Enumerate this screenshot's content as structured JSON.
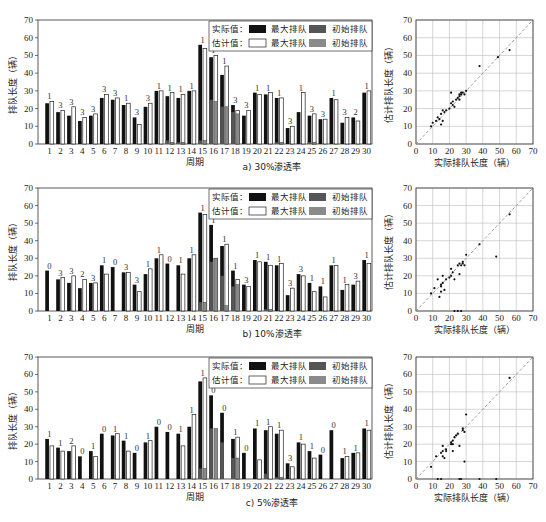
{
  "labels": {
    "y_bar": "排队长度（辆）",
    "x_bar": "周期",
    "y_scatter": "估计排队长度（辆）",
    "x_scatter": "实际排队长度（辆）",
    "legend_actual": "实际值：",
    "legend_est": "估计值：",
    "legend_max": "最大排队",
    "legend_init": "初始排队"
  },
  "colors": {
    "actual_max": "#111111",
    "actual_init": "#555555",
    "est_max": "#ffffff",
    "est_init": "#8a8a8a",
    "diag": "#888888"
  },
  "chart_data": [
    {
      "type": "bar",
      "caption": "a) 30%渗透率",
      "xlabel": "周期",
      "ylabel": "排队长度（辆）",
      "ylim": [
        0,
        70
      ],
      "categories": [
        1,
        2,
        3,
        4,
        5,
        6,
        7,
        8,
        9,
        10,
        11,
        12,
        13,
        14,
        15,
        16,
        17,
        18,
        19,
        20,
        21,
        22,
        23,
        24,
        25,
        26,
        27,
        28,
        29,
        30
      ],
      "series": [
        {
          "name": "实际值 最大排队",
          "values": [
            23,
            18,
            16,
            13,
            16,
            26,
            25,
            22,
            15,
            21,
            30,
            27,
            26,
            30,
            56,
            49,
            39,
            22,
            16,
            29,
            28,
            26,
            9,
            18,
            16,
            14,
            26,
            12,
            15,
            29
          ]
        },
        {
          "name": "估计值 最大排队",
          "values": [
            24,
            19,
            21,
            15,
            17,
            28,
            26,
            23,
            11,
            23,
            30,
            29,
            28,
            30,
            54,
            50,
            44,
            19,
            19,
            28,
            29,
            26,
            10,
            29,
            17,
            14,
            25,
            15,
            13,
            30
          ]
        },
        {
          "name": "实际值 初始排队",
          "values": [
            0,
            0,
            0,
            0,
            0,
            0,
            0,
            0,
            0,
            0,
            0,
            2,
            1,
            0,
            2,
            25,
            21,
            18,
            0,
            0,
            0,
            1,
            0,
            0,
            1,
            0,
            0,
            0,
            0,
            0
          ]
        },
        {
          "name": "估计值 初始排队",
          "values": [
            0,
            0,
            0,
            0,
            0,
            0,
            0,
            0,
            0,
            0,
            0,
            1,
            1,
            0,
            2,
            24,
            21,
            17,
            0,
            0,
            0,
            1,
            0,
            0,
            1,
            0,
            0,
            0,
            0,
            0
          ]
        }
      ],
      "annotations": [
        "1",
        "3",
        "3",
        "3",
        "3",
        "3",
        "3",
        "1",
        "3",
        "3",
        "1",
        "1",
        "1",
        "1",
        "1",
        "1",
        "1",
        "3",
        "3",
        "1",
        "1",
        "1",
        "3",
        "1",
        "3",
        "3",
        "1",
        "3",
        "2",
        "1"
      ]
    },
    {
      "type": "bar",
      "caption": "b) 10%渗透率",
      "xlabel": "周期",
      "ylabel": "排队长度（辆）",
      "ylim": [
        0,
        70
      ],
      "categories": [
        1,
        2,
        3,
        4,
        5,
        6,
        7,
        8,
        9,
        10,
        11,
        12,
        13,
        14,
        15,
        16,
        17,
        18,
        19,
        20,
        21,
        22,
        23,
        24,
        25,
        26,
        27,
        28,
        29,
        30
      ],
      "series": [
        {
          "name": "实际值 最大排队",
          "values": [
            23,
            18,
            16,
            13,
            16,
            26,
            25,
            22,
            15,
            21,
            30,
            27,
            26,
            30,
            56,
            49,
            37,
            23,
            15,
            29,
            28,
            26,
            9,
            21,
            16,
            14,
            26,
            12,
            15,
            29
          ]
        },
        {
          "name": "估计值 最大排队",
          "values": [
            0,
            19,
            20,
            18,
            16,
            21,
            0,
            22,
            11,
            24,
            32,
            0,
            21,
            32,
            55,
            30,
            38,
            18,
            14,
            28,
            26,
            27,
            13,
            20,
            11,
            8,
            26,
            15,
            17,
            27
          ]
        },
        {
          "name": "实际值 初始排队",
          "values": [
            0,
            0,
            0,
            0,
            0,
            0,
            0,
            0,
            0,
            0,
            0,
            0,
            0,
            0,
            5,
            28,
            20,
            14,
            0,
            0,
            1,
            0,
            0,
            0,
            0,
            0,
            0,
            0,
            0,
            0
          ]
        },
        {
          "name": "估计值 初始排队",
          "values": [
            0,
            0,
            0,
            0,
            0,
            0,
            0,
            0,
            0,
            0,
            0,
            0,
            0,
            0,
            5,
            30,
            3,
            15,
            0,
            0,
            1,
            0,
            0,
            0,
            0,
            0,
            0,
            0,
            0,
            0
          ]
        }
      ],
      "annotations": [
        "0",
        "3",
        "3",
        "2",
        "3",
        "1",
        "0",
        "3",
        "3",
        "1",
        "1",
        "0",
        "1",
        "1",
        "1",
        "1",
        "1",
        "1",
        "3",
        "1",
        "1",
        "1",
        "3",
        "3",
        "1",
        "1",
        "1",
        "1",
        "3",
        "1"
      ]
    },
    {
      "type": "bar",
      "caption": "c) 5%渗透率",
      "xlabel": "周期",
      "ylabel": "排队长度（辆）",
      "ylim": [
        0,
        70
      ],
      "categories": [
        1,
        2,
        3,
        4,
        5,
        6,
        7,
        8,
        9,
        10,
        11,
        12,
        13,
        14,
        15,
        16,
        17,
        18,
        19,
        20,
        21,
        22,
        23,
        24,
        25,
        26,
        27,
        28,
        29,
        30
      ],
      "series": [
        {
          "name": "实际值 最大排队",
          "values": [
            23,
            18,
            16,
            13,
            16,
            26,
            25,
            22,
            15,
            21,
            30,
            27,
            26,
            30,
            56,
            48,
            38,
            23,
            15,
            29,
            28,
            26,
            9,
            21,
            16,
            14,
            28,
            12,
            15,
            29
          ]
        },
        {
          "name": "估计值 最大排队",
          "values": [
            19,
            16,
            19,
            0,
            13,
            0,
            26,
            16,
            0,
            22,
            0,
            0,
            19,
            37,
            58,
            0,
            0,
            24,
            0,
            11,
            30,
            28,
            7,
            20,
            12,
            0,
            0,
            13,
            15,
            28
          ]
        },
        {
          "name": "实际值 初始排队",
          "values": [
            0,
            0,
            0,
            0,
            0,
            0,
            0,
            0,
            0,
            0,
            0,
            0,
            0,
            0,
            6,
            29,
            21,
            12,
            0,
            0,
            3,
            1,
            0,
            0,
            0,
            0,
            0,
            0,
            0,
            0
          ]
        },
        {
          "name": "估计值 初始排队",
          "values": [
            0,
            0,
            0,
            0,
            0,
            0,
            0,
            0,
            0,
            0,
            0,
            0,
            0,
            0,
            6,
            29,
            0,
            12,
            0,
            0,
            0,
            1,
            0,
            0,
            0,
            0,
            0,
            0,
            0,
            0
          ]
        }
      ],
      "annotations": [
        "1",
        "1",
        "2",
        "0",
        "1",
        "0",
        "1",
        "1",
        "0",
        "1",
        "0",
        "0",
        "1",
        "1",
        "1",
        "0",
        "0",
        "1",
        "0",
        "1",
        "1",
        "1",
        "3",
        "1",
        "1",
        "0",
        "0",
        "1",
        "1",
        "1"
      ]
    },
    {
      "type": "scatter",
      "caption": "a) 30%渗透率",
      "xlabel": "实际排队长度（辆）",
      "ylabel": "估计排队长度（辆）",
      "xlim": [
        0,
        70
      ],
      "ylim": [
        0,
        70
      ],
      "grid": true,
      "diagonal": true,
      "points": [
        [
          9,
          10
        ],
        [
          10,
          12
        ],
        [
          12,
          13
        ],
        [
          13,
          15
        ],
        [
          14,
          14
        ],
        [
          15,
          11
        ],
        [
          15,
          17
        ],
        [
          16,
          19
        ],
        [
          16,
          13
        ],
        [
          17,
          18
        ],
        [
          18,
          19
        ],
        [
          21,
          29
        ],
        [
          21,
          23
        ],
        [
          22,
          22
        ],
        [
          23,
          21
        ],
        [
          24,
          25
        ],
        [
          25,
          26
        ],
        [
          26,
          27
        ],
        [
          26,
          25
        ],
        [
          27,
          28
        ],
        [
          27,
          29
        ],
        [
          28,
          29
        ],
        [
          29,
          28
        ],
        [
          30,
          30
        ],
        [
          38,
          44
        ],
        [
          49,
          49
        ],
        [
          56,
          53
        ],
        [
          26,
          28
        ],
        [
          22,
          24
        ],
        [
          20,
          20
        ]
      ]
    },
    {
      "type": "scatter",
      "caption": "b) 10%渗透率",
      "xlabel": "实际排队长度（辆）",
      "ylabel": "估计排队长度（辆）",
      "xlim": [
        0,
        70
      ],
      "ylim": [
        0,
        70
      ],
      "grid": true,
      "diagonal": true,
      "points": [
        [
          9,
          10
        ],
        [
          11,
          13
        ],
        [
          13,
          18
        ],
        [
          14,
          8
        ],
        [
          15,
          11
        ],
        [
          15,
          14
        ],
        [
          16,
          16
        ],
        [
          16,
          20
        ],
        [
          17,
          12
        ],
        [
          18,
          18
        ],
        [
          21,
          20
        ],
        [
          21,
          24
        ],
        [
          22,
          22
        ],
        [
          23,
          18
        ],
        [
          25,
          26
        ],
        [
          26,
          21
        ],
        [
          26,
          27
        ],
        [
          27,
          26
        ],
        [
          28,
          28
        ],
        [
          29,
          26
        ],
        [
          30,
          32
        ],
        [
          38,
          38
        ],
        [
          48,
          31
        ],
        [
          56,
          55
        ],
        [
          23,
          0
        ],
        [
          25,
          0
        ],
        [
          27,
          0
        ],
        [
          20,
          19
        ],
        [
          15,
          15
        ],
        [
          28,
          27
        ]
      ]
    },
    {
      "type": "scatter",
      "caption": "c) 5%渗透率",
      "xlabel": "实际排队长度（辆）",
      "ylabel": "估计排队长度（辆）",
      "xlim": [
        0,
        70
      ],
      "ylim": [
        0,
        70
      ],
      "grid": true,
      "diagonal": true,
      "points": [
        [
          9,
          7
        ],
        [
          12,
          13
        ],
        [
          13,
          0
        ],
        [
          15,
          0
        ],
        [
          16,
          16
        ],
        [
          16,
          13
        ],
        [
          16,
          19
        ],
        [
          18,
          16
        ],
        [
          21,
          21
        ],
        [
          21,
          20
        ],
        [
          22,
          22
        ],
        [
          22,
          16
        ],
        [
          23,
          24
        ],
        [
          25,
          26
        ],
        [
          26,
          19
        ],
        [
          26,
          0
        ],
        [
          27,
          0
        ],
        [
          28,
          28
        ],
        [
          29,
          10
        ],
        [
          29,
          27
        ],
        [
          30,
          37
        ],
        [
          56,
          58
        ],
        [
          48,
          0
        ],
        [
          15,
          15
        ],
        [
          22,
          20
        ],
        [
          24,
          25
        ],
        [
          18,
          17
        ],
        [
          17,
          12
        ],
        [
          28,
          29
        ],
        [
          38,
          0
        ]
      ]
    }
  ]
}
